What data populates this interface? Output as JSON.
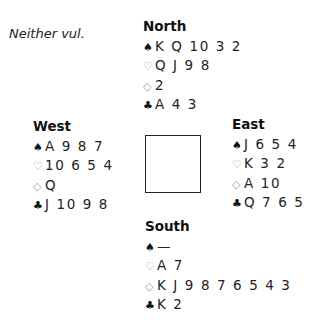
{
  "vulnerability": "Neither vul.",
  "suit_icons": {
    "spades": "♠",
    "hearts": "♡",
    "diamonds": "◇",
    "clubs": "♣"
  },
  "hands": {
    "north": {
      "name": "North",
      "spades": "K Q 10 3 2",
      "hearts": "Q J 9 8",
      "diamonds": "2",
      "clubs": "A 4 3"
    },
    "west": {
      "name": "West",
      "spades": "A 9 8 7",
      "hearts": "10 6 5 4",
      "diamonds": "Q",
      "clubs": "J 10 9 8"
    },
    "east": {
      "name": "East",
      "spades": "J 6 5 4",
      "hearts": "K 3 2",
      "diamonds": "A 10",
      "clubs": "Q 7 6 5"
    },
    "south": {
      "name": "South",
      "spades": "—",
      "hearts": "A 7",
      "diamonds": "K J 9 8 7 6 5 4 3",
      "clubs": "K 2"
    }
  }
}
